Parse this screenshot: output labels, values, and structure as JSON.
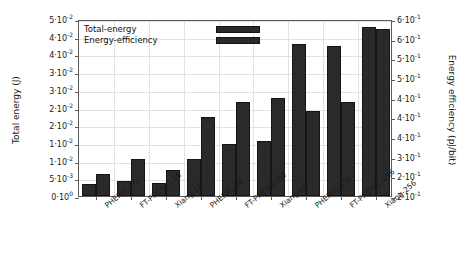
{
  "chart_data": {
    "type": "bar",
    "title": "",
    "xlabel": "",
    "ylabel": "Total energy (J)",
    "ylabel_right": "Energy efficiency (pJ/bit)",
    "categories": [
      "PHENIC-16",
      "FT-PHENIC-16",
      "Xiang-16",
      "PHENIC-64",
      "FT-PHENIC-64",
      "Xiang-64",
      "PHENIC-256",
      "FT-PHENIC-256",
      "Xiang-256"
    ],
    "series": [
      {
        "name": "Total-energy",
        "axis": "left",
        "color": "#2a2a2a",
        "values": [
          0.0033,
          0.0042,
          0.0036,
          0.0105,
          0.0148,
          0.0155,
          0.043,
          0.0425,
          0.0478
        ]
      },
      {
        "name": "Energy-efficiency",
        "axis": "right",
        "color": "#2a2a2a",
        "values": [
          0.255,
          0.295,
          0.265,
          0.4,
          0.44,
          0.45,
          0.415,
          0.44,
          0.625
        ]
      }
    ],
    "ylim": [
      0,
      0.05
    ],
    "ylim_right": [
      0.2,
      0.65
    ],
    "yticks": [
      0,
      0.005,
      0.01,
      0.015,
      0.02,
      0.025,
      0.03,
      0.035,
      0.04,
      0.045,
      0.05
    ],
    "ytick_labels": [
      {
        "mant": "0",
        "exp": "0"
      },
      {
        "mant": "5",
        "exp": "-3"
      },
      {
        "mant": "1",
        "exp": "-2"
      },
      {
        "mant": "1",
        "exp": "-2"
      },
      {
        "mant": "2",
        "exp": "-2"
      },
      {
        "mant": "2",
        "exp": "-2"
      },
      {
        "mant": "3",
        "exp": "-2"
      },
      {
        "mant": "3",
        "exp": "-2"
      },
      {
        "mant": "4",
        "exp": "-2"
      },
      {
        "mant": "4",
        "exp": "-2"
      },
      {
        "mant": "5",
        "exp": "-2"
      }
    ],
    "yticks_right": [
      0.2,
      0.25,
      0.3,
      0.35,
      0.4,
      0.45,
      0.5,
      0.55,
      0.6,
      0.65
    ],
    "ytick_labels_right": [
      {
        "mant": "2",
        "exp": "-1"
      },
      {
        "mant": "2",
        "exp": "-1"
      },
      {
        "mant": "3",
        "exp": "-1"
      },
      {
        "mant": "4",
        "exp": "-1"
      },
      {
        "mant": "4",
        "exp": "-1"
      },
      {
        "mant": "4",
        "exp": "-1"
      },
      {
        "mant": "5",
        "exp": "-1"
      },
      {
        "mant": "5",
        "exp": "-1"
      },
      {
        "mant": "6",
        "exp": "-1"
      },
      {
        "mant": "6",
        "exp": "-1"
      }
    ],
    "grid": true,
    "legend_position": "top-left"
  },
  "legend": {
    "entries": [
      {
        "label": "Total-energy"
      },
      {
        "label": "Energy-efficiency"
      }
    ]
  }
}
